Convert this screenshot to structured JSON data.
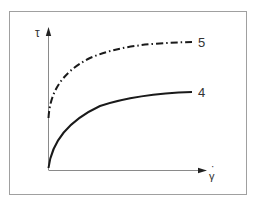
{
  "diagram": {
    "type": "flow-curve",
    "y_axis": {
      "label": "τ"
    },
    "x_axis": {
      "label": "γ̇",
      "label_base": "γ",
      "label_dot": "·"
    },
    "curves": [
      {
        "id": "5",
        "label": "5",
        "style": "dash-dot"
      },
      {
        "id": "4",
        "label": "4",
        "style": "solid"
      }
    ],
    "colors": {
      "frame": "#9a9a9a",
      "axis": "#8a8a8a",
      "curve": "#1a1a1a",
      "text": "#333333"
    }
  }
}
